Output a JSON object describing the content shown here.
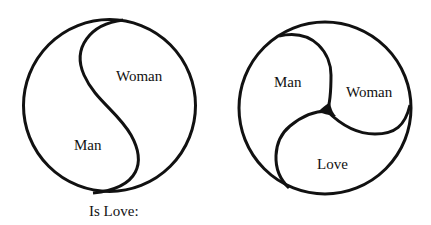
{
  "left_diagram": {
    "labels": {
      "top": "Woman",
      "bottom": "Man"
    },
    "caption": "Is Love:"
  },
  "right_diagram": {
    "labels": {
      "top_left": "Man",
      "right": "Woman",
      "bottom": "Love"
    }
  },
  "colors": {
    "stroke": "#111111",
    "background": "#ffffff"
  }
}
